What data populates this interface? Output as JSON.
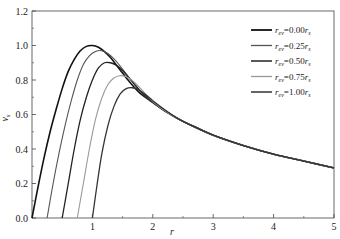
{
  "chart_data": {
    "type": "line",
    "title": "",
    "xlabel": "r",
    "ylabel": "v_s",
    "xlim": [
      0,
      5
    ],
    "ylim": [
      0,
      1.2
    ],
    "xticks": [
      "1",
      "2",
      "3",
      "4",
      "5"
    ],
    "yticks": [
      "0.0",
      "0.2",
      "0.4",
      "0.6",
      "0.8",
      "1.0",
      "1.2"
    ],
    "grid": false,
    "legend_position": "upper right",
    "series": [
      {
        "name": "r_ev=0.00r_s",
        "label_main": "r",
        "label_sub": "ev",
        "label_rest": "=0.00r",
        "label_sub2": "s",
        "color": "#111111",
        "width": 1.6,
        "points": [
          [
            0,
            0
          ],
          [
            0.1,
            0.18
          ],
          [
            0.2,
            0.35
          ],
          [
            0.3,
            0.5
          ],
          [
            0.4,
            0.63
          ],
          [
            0.5,
            0.75
          ],
          [
            0.6,
            0.85
          ],
          [
            0.7,
            0.92
          ],
          [
            0.8,
            0.97
          ],
          [
            0.9,
            0.995
          ],
          [
            1.0,
            1.0
          ],
          [
            1.1,
            0.99
          ],
          [
            1.2,
            0.965
          ],
          [
            1.3,
            0.93
          ],
          [
            1.4,
            0.885
          ],
          [
            1.5,
            0.84
          ],
          [
            1.6,
            0.795
          ],
          [
            1.7,
            0.755
          ],
          [
            1.8,
            0.72
          ],
          [
            2.0,
            0.67
          ],
          [
            2.25,
            0.61
          ],
          [
            2.5,
            0.56
          ],
          [
            2.75,
            0.52
          ],
          [
            3.0,
            0.48
          ],
          [
            3.5,
            0.42
          ],
          [
            4.0,
            0.37
          ],
          [
            4.5,
            0.33
          ],
          [
            5.0,
            0.29
          ]
        ]
      },
      {
        "name": "r_ev=0.25r_s",
        "label_main": "r",
        "label_sub": "ev",
        "label_rest": "=0.25r",
        "label_sub2": "s",
        "color": "#555555",
        "width": 1.1,
        "points": [
          [
            0.25,
            0
          ],
          [
            0.35,
            0.2
          ],
          [
            0.45,
            0.38
          ],
          [
            0.55,
            0.54
          ],
          [
            0.65,
            0.68
          ],
          [
            0.75,
            0.8
          ],
          [
            0.85,
            0.89
          ],
          [
            0.95,
            0.94
          ],
          [
            1.05,
            0.965
          ],
          [
            1.15,
            0.97
          ],
          [
            1.25,
            0.955
          ],
          [
            1.35,
            0.925
          ],
          [
            1.45,
            0.885
          ],
          [
            1.55,
            0.84
          ],
          [
            1.65,
            0.795
          ],
          [
            1.8,
            0.73
          ],
          [
            2.0,
            0.67
          ],
          [
            2.25,
            0.61
          ],
          [
            2.5,
            0.56
          ],
          [
            3.0,
            0.48
          ],
          [
            3.5,
            0.42
          ],
          [
            4.0,
            0.37
          ],
          [
            4.5,
            0.33
          ],
          [
            5.0,
            0.29
          ]
        ]
      },
      {
        "name": "r_ev=0.50r_s",
        "label_main": "r",
        "label_sub": "ev",
        "label_rest": "=0.50r",
        "label_sub2": "s",
        "color": "#222222",
        "width": 1.3,
        "points": [
          [
            0.5,
            0
          ],
          [
            0.6,
            0.2
          ],
          [
            0.7,
            0.4
          ],
          [
            0.8,
            0.57
          ],
          [
            0.9,
            0.7
          ],
          [
            1.0,
            0.8
          ],
          [
            1.1,
            0.87
          ],
          [
            1.2,
            0.9
          ],
          [
            1.3,
            0.9
          ],
          [
            1.4,
            0.885
          ],
          [
            1.5,
            0.855
          ],
          [
            1.6,
            0.815
          ],
          [
            1.7,
            0.775
          ],
          [
            1.8,
            0.735
          ],
          [
            2.0,
            0.67
          ],
          [
            2.25,
            0.61
          ],
          [
            2.5,
            0.56
          ],
          [
            3.0,
            0.48
          ],
          [
            3.5,
            0.42
          ],
          [
            4.0,
            0.37
          ],
          [
            4.5,
            0.33
          ],
          [
            5.0,
            0.29
          ]
        ]
      },
      {
        "name": "r_ev=0.75r_s",
        "label_main": "r",
        "label_sub": "ev",
        "label_rest": "=0.75r",
        "label_sub2": "s",
        "color": "#999999",
        "width": 1.1,
        "points": [
          [
            0.75,
            0
          ],
          [
            0.85,
            0.2
          ],
          [
            0.95,
            0.4
          ],
          [
            1.05,
            0.57
          ],
          [
            1.15,
            0.69
          ],
          [
            1.25,
            0.77
          ],
          [
            1.35,
            0.81
          ],
          [
            1.45,
            0.825
          ],
          [
            1.55,
            0.82
          ],
          [
            1.65,
            0.8
          ],
          [
            1.8,
            0.75
          ],
          [
            2.0,
            0.675
          ],
          [
            2.25,
            0.61
          ],
          [
            2.5,
            0.56
          ],
          [
            3.0,
            0.48
          ],
          [
            3.5,
            0.42
          ],
          [
            4.0,
            0.37
          ],
          [
            4.5,
            0.33
          ],
          [
            5.0,
            0.29
          ]
        ]
      },
      {
        "name": "r_ev=1.00r_s",
        "label_main": "r",
        "label_sub": "ev",
        "label_rest": "=1.00r",
        "label_sub2": "s",
        "color": "#333333",
        "width": 1.3,
        "points": [
          [
            1.0,
            0
          ],
          [
            1.08,
            0.2
          ],
          [
            1.16,
            0.38
          ],
          [
            1.26,
            0.54
          ],
          [
            1.36,
            0.65
          ],
          [
            1.46,
            0.72
          ],
          [
            1.56,
            0.75
          ],
          [
            1.66,
            0.755
          ],
          [
            1.76,
            0.745
          ],
          [
            1.9,
            0.71
          ],
          [
            2.0,
            0.68
          ],
          [
            2.25,
            0.615
          ],
          [
            2.5,
            0.56
          ],
          [
            3.0,
            0.48
          ],
          [
            3.5,
            0.42
          ],
          [
            4.0,
            0.37
          ],
          [
            4.5,
            0.33
          ],
          [
            5.0,
            0.29
          ]
        ]
      }
    ]
  }
}
